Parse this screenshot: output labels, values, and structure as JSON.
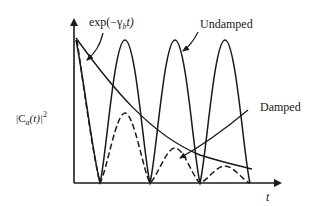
{
  "figure": {
    "labels": {
      "envelope": "exp(−γ",
      "envelope_sub": "b",
      "envelope_tail": "t)",
      "undamped": "Undamped",
      "damped": "Damped",
      "x_axis": "t",
      "y_axis_pre": "|C",
      "y_axis_sub": "a",
      "y_axis_mid": "(t)|",
      "y_axis_sup": "2"
    },
    "colors": {
      "ink": "#1a1a1a",
      "background": "#ffffff"
    },
    "curves": [
      {
        "name": "Undamped",
        "style": "solid",
        "description": "periodic oscillation of |C_a(t)|^2 with constant amplitude"
      },
      {
        "name": "Damped",
        "style": "dashed",
        "description": "oscillation with amplitude decaying under exp(-γ_b t)"
      },
      {
        "name": "exp(−γ_b t)",
        "style": "solid",
        "description": "exponential decay envelope"
      }
    ]
  }
}
